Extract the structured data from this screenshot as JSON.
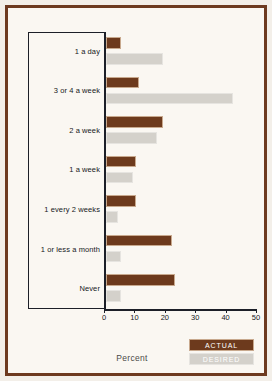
{
  "chart_data": {
    "type": "bar",
    "orientation": "horizontal",
    "title": "",
    "xlabel": "Percent",
    "ylabel": "",
    "xlim": [
      0,
      50
    ],
    "xticks": [
      0,
      10,
      20,
      30,
      40,
      50
    ],
    "xtick_labels": [
      "0",
      "10",
      "20",
      "30",
      "40",
      "50"
    ],
    "grid": false,
    "legend_position": "bottom-right",
    "categories": [
      "1 a day",
      "3 or 4 a week",
      "2 a week",
      "1 a week",
      "1 every 2 weeks",
      "1 or less a month",
      "Never"
    ],
    "series": [
      {
        "name": "ACTUAL",
        "color": "#6d3a1d",
        "values": [
          5,
          11,
          19,
          10,
          10,
          22,
          23
        ]
      },
      {
        "name": "DESIRED",
        "color": "#d4d1cb",
        "values": [
          19,
          42,
          17,
          9,
          4,
          5,
          5
        ]
      }
    ]
  },
  "legend": {
    "items": [
      {
        "label": "ACTUAL"
      },
      {
        "label": "DESIRED"
      }
    ]
  },
  "colors": {
    "actual": "#6d3a1d",
    "desired": "#d4d1cb",
    "frame": "#6d3a20",
    "axis": "#1c1f28",
    "background": "#faf7f2"
  }
}
